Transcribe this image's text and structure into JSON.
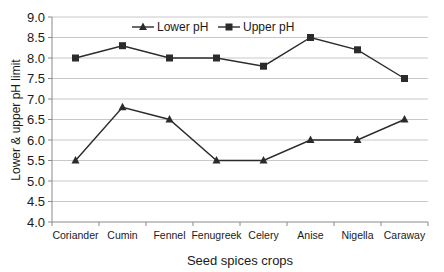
{
  "chart_data": {
    "type": "line",
    "title": "",
    "xlabel": "Seed spices crops",
    "ylabel": "Lower & upper pH limit",
    "ylim": [
      4.0,
      9.0
    ],
    "yticks": [
      "4.0",
      "4.5",
      "5.0",
      "5.5",
      "6.0",
      "6.5",
      "7.0",
      "7.5",
      "8.0",
      "8.5",
      "9.0"
    ],
    "grid": true,
    "legend_position": "top-inside",
    "categories": [
      "Coriander",
      "Cumin",
      "Fennel",
      "Fenugreek",
      "Celery",
      "Anise",
      "Nigella",
      "Caraway"
    ],
    "series": [
      {
        "name": "Lower pH",
        "marker": "triangle",
        "values": [
          5.5,
          6.8,
          6.5,
          5.5,
          5.5,
          6.0,
          6.0,
          6.5
        ]
      },
      {
        "name": "Upper pH",
        "marker": "square",
        "values": [
          8.0,
          8.3,
          8.0,
          8.0,
          7.8,
          8.5,
          8.2,
          7.5
        ]
      }
    ]
  },
  "colors": {
    "line": "#2b2b2b",
    "grid": "#c8c8c8",
    "axis": "#8a8a8a",
    "text": "#1a1a1a"
  }
}
